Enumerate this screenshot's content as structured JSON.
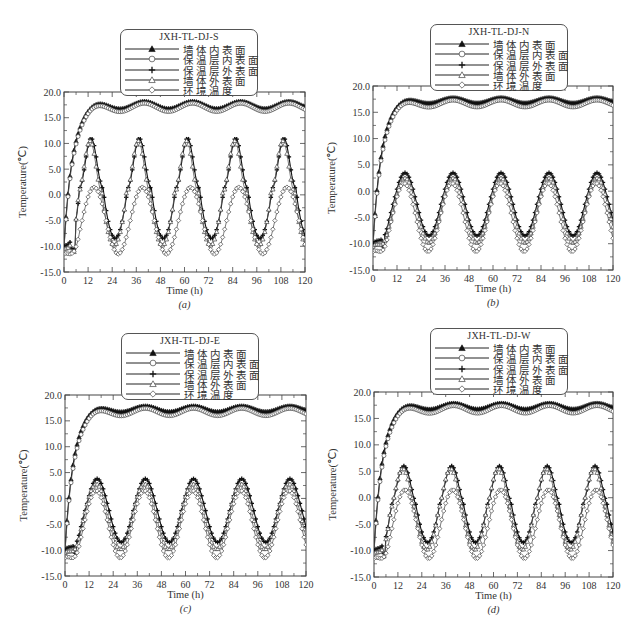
{
  "chart_data": [
    {
      "id": "a",
      "type": "line",
      "title": "JXH-TL-DJ-S",
      "panel_label": "(a)",
      "xlabel": "Time (h)",
      "ylabel": "Temperature(℃)",
      "xlim": [
        0,
        120
      ],
      "ylim": [
        -15,
        20
      ],
      "xticks": [
        0,
        12,
        24,
        36,
        48,
        60,
        72,
        84,
        96,
        108,
        120
      ],
      "yticks": [
        "-15.0",
        "-10.0",
        "-5.0",
        "0.0",
        "5.0",
        "10.0",
        "15.0",
        "20.0"
      ],
      "grid": false,
      "legend_position": "top-center-overlapping",
      "series": [
        {
          "name": "墙体内表面",
          "marker": "filled-triangle",
          "start": -10.0,
          "plateau_max": 18.2,
          "plateau_min": 16.8,
          "period_h": 24
        },
        {
          "name": "保温层内表面",
          "marker": "open-circle",
          "start": -10.5,
          "plateau_max": 17.8,
          "plateau_min": 16.2,
          "period_h": 24
        },
        {
          "name": "保温层外表面",
          "marker": "plus",
          "start": -10.0,
          "peak": 11.0,
          "trough": -8.5,
          "peak_hour": 13.5,
          "period_h": 24
        },
        {
          "name": "墙体外表面",
          "marker": "open-triangle",
          "start": -10.5,
          "peak": 10.5,
          "trough": -9.8,
          "peak_hour": 13.0,
          "period_h": 24
        },
        {
          "name": "环境温度",
          "marker": "open-diamond",
          "start": -11.5,
          "peak": 1.5,
          "trough": -11.5,
          "peak_hour": 15.0,
          "period_h": 24
        }
      ]
    },
    {
      "id": "b",
      "type": "line",
      "title": "JXH-TL-DJ-N",
      "panel_label": "(b)",
      "xlabel": "Time (h)",
      "ylabel": "Temperature(℃)",
      "xlim": [
        0,
        120
      ],
      "ylim": [
        -15,
        20
      ],
      "xticks": [
        0,
        12,
        24,
        36,
        48,
        60,
        72,
        84,
        96,
        108,
        120
      ],
      "yticks": [
        "-15.0",
        "-10.0",
        "-5.0",
        "0.0",
        "5.0",
        "10.0",
        "15.0",
        "20.0"
      ],
      "grid": false,
      "legend_position": "top-center-overlapping",
      "series": [
        {
          "name": "墙体内表面",
          "marker": "filled-triangle",
          "start": -10.0,
          "plateau_max": 17.8,
          "plateau_min": 16.8,
          "period_h": 24
        },
        {
          "name": "保温层内表面",
          "marker": "open-circle",
          "start": -10.5,
          "plateau_max": 17.3,
          "plateau_min": 16.0,
          "period_h": 24
        },
        {
          "name": "保温层外表面",
          "marker": "plus",
          "start": -10.0,
          "peak": 3.5,
          "trough": -8.5,
          "peak_hour": 16.0,
          "period_h": 24
        },
        {
          "name": "墙体外表面",
          "marker": "open-triangle",
          "start": -10.5,
          "peak": 2.5,
          "trough": -9.8,
          "peak_hour": 16.0,
          "period_h": 24
        },
        {
          "name": "环境温度",
          "marker": "open-diamond",
          "start": -11.5,
          "peak": 1.5,
          "trough": -11.5,
          "peak_hour": 15.5,
          "period_h": 24
        }
      ]
    },
    {
      "id": "c",
      "type": "line",
      "title": "JXH-TL-DJ-E",
      "panel_label": "(c)",
      "xlabel": "Time (h)",
      "ylabel": "Temperature(℃)",
      "xlim": [
        0,
        120
      ],
      "ylim": [
        -15,
        20
      ],
      "xticks": [
        0,
        12,
        24,
        36,
        48,
        60,
        72,
        84,
        96,
        108,
        120
      ],
      "yticks": [
        "-15.0",
        "-10.0",
        "-5.0",
        "0.0",
        "5.0",
        "10.0",
        "15.0",
        "20.0"
      ],
      "grid": false,
      "legend_position": "top-center-overlapping",
      "series": [
        {
          "name": "墙体内表面",
          "marker": "filled-triangle",
          "start": -10.0,
          "plateau_max": 17.9,
          "plateau_min": 16.8,
          "period_h": 24
        },
        {
          "name": "保温层内表面",
          "marker": "open-circle",
          "start": -10.5,
          "plateau_max": 17.4,
          "plateau_min": 16.0,
          "period_h": 24
        },
        {
          "name": "保温层外表面",
          "marker": "plus",
          "start": -10.0,
          "peak": 3.8,
          "trough": -8.5,
          "peak_hour": 16.0,
          "period_h": 24
        },
        {
          "name": "墙体外表面",
          "marker": "open-triangle",
          "start": -10.5,
          "peak": 2.8,
          "trough": -9.8,
          "peak_hour": 15.5,
          "period_h": 24
        },
        {
          "name": "环境温度",
          "marker": "open-diamond",
          "start": -11.5,
          "peak": 1.5,
          "trough": -11.5,
          "peak_hour": 15.5,
          "period_h": 24
        }
      ]
    },
    {
      "id": "d",
      "type": "line",
      "title": "JXH-TL-DJ-W",
      "panel_label": "(d)",
      "xlabel": "Time (h)",
      "ylabel": "Temperature(℃)",
      "xlim": [
        0,
        120
      ],
      "ylim": [
        -15,
        20
      ],
      "xticks": [
        0,
        12,
        24,
        36,
        48,
        60,
        72,
        84,
        96,
        108,
        120
      ],
      "yticks": [
        "-15.0",
        "-10.0",
        "-5.0",
        "0.0",
        "5.0",
        "10.0",
        "15.0",
        "20.0"
      ],
      "grid": false,
      "legend_position": "top-center-overlapping",
      "series": [
        {
          "name": "墙体内表面",
          "marker": "filled-triangle",
          "start": -10.0,
          "plateau_max": 17.9,
          "plateau_min": 16.8,
          "period_h": 24
        },
        {
          "name": "保温层内表面",
          "marker": "open-circle",
          "start": -10.5,
          "plateau_max": 17.4,
          "plateau_min": 16.0,
          "period_h": 24
        },
        {
          "name": "保温层外表面",
          "marker": "plus",
          "start": -10.0,
          "peak": 6.0,
          "trough": -8.5,
          "peak_hour": 15.0,
          "period_h": 24
        },
        {
          "name": "墙体外表面",
          "marker": "open-triangle",
          "start": -10.5,
          "peak": 5.5,
          "trough": -9.8,
          "peak_hour": 14.5,
          "period_h": 24
        },
        {
          "name": "环境温度",
          "marker": "open-diamond",
          "start": -11.5,
          "peak": 1.5,
          "trough": -11.5,
          "peak_hour": 15.5,
          "period_h": 24
        }
      ]
    }
  ],
  "layout": {
    "panels": [
      {
        "left": 64,
        "top": 92,
        "width": 241,
        "height": 180,
        "legend": {
          "left": 120,
          "top": 29,
          "width": 138,
          "height": 67
        }
      },
      {
        "left": 373,
        "top": 86,
        "width": 240,
        "height": 184,
        "legend": {
          "left": 430,
          "top": 24,
          "width": 138,
          "height": 67
        }
      },
      {
        "left": 65,
        "top": 395,
        "width": 241,
        "height": 181,
        "legend": {
          "left": 121,
          "top": 333,
          "width": 138,
          "height": 67
        }
      },
      {
        "left": 374,
        "top": 392,
        "width": 239,
        "height": 185,
        "legend": {
          "left": 430,
          "top": 328,
          "width": 138,
          "height": 67
        }
      }
    ]
  }
}
